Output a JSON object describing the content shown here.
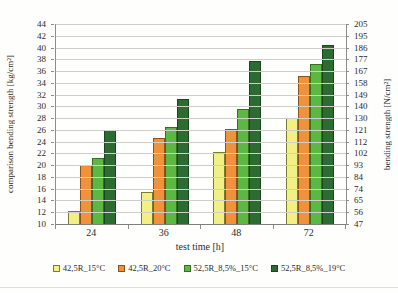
{
  "chart_data": {
    "type": "bar",
    "title": "",
    "categories": [
      "24",
      "36",
      "48",
      "72"
    ],
    "series": [
      {
        "name": "42,5R_15°C",
        "color": "#f1ef85",
        "border_color": "#7b7b33",
        "values": [
          12.2,
          15.5,
          22.3,
          28.0
        ]
      },
      {
        "name": "42,5R_20°C",
        "color": "#f0923c",
        "border_color": "#8a521c",
        "values": [
          20.0,
          24.6,
          26.1,
          35.2
        ]
      },
      {
        "name": "52,5R_8,5%_15°C",
        "color": "#5db745",
        "border_color": "#34701f",
        "values": [
          21.2,
          26.5,
          29.5,
          37.2
        ]
      },
      {
        "name": "52,5R_8,5%_19°C",
        "color": "#2c6b32",
        "border_color": "#1c441f",
        "values": [
          26.0,
          31.3,
          37.8,
          40.5
        ]
      }
    ],
    "xlabel": "test time [h]",
    "ylabel_left": "comparison bending strength [kg/cm²]",
    "ylabel_right": "bending strength [N/cm²]",
    "ylim_left": [
      10,
      44
    ],
    "ylim_right": [
      47,
      205
    ],
    "y_left_ticks": [
      44,
      42,
      40,
      38,
      36,
      34,
      32,
      30,
      28,
      26,
      24,
      22,
      20,
      18,
      16,
      14,
      12,
      10
    ],
    "y_right_ticks": [
      205,
      195,
      186,
      177,
      167,
      158,
      149,
      140,
      130,
      121,
      112,
      102,
      93,
      84,
      74,
      65,
      56,
      47
    ],
    "grid": true,
    "legend_position": "bottom",
    "colors": {
      "gridline": "#cfcfca",
      "axis": "#8d8d89",
      "background": "#fefefd"
    }
  }
}
